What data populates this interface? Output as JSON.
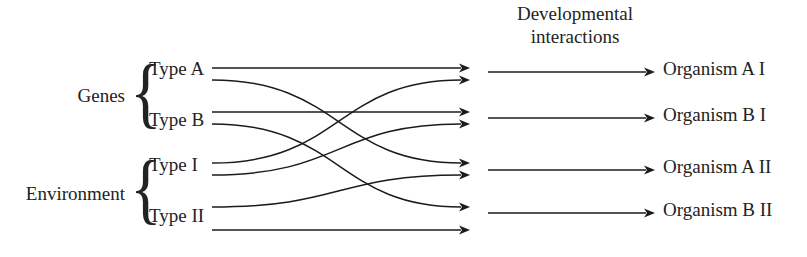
{
  "figure": {
    "title_line1": "Developmental",
    "title_line2": "interactions",
    "background_color": "#ffffff",
    "line_color": "#1b1b1b",
    "text_color": "#232323"
  },
  "groups": [
    {
      "id": "genes",
      "label": "Genes",
      "brace": "{",
      "types": [
        {
          "id": "type-a",
          "label": "Type A"
        },
        {
          "id": "type-b",
          "label": "Type B"
        }
      ]
    },
    {
      "id": "environment",
      "label": "Environment",
      "brace": "{",
      "types": [
        {
          "id": "type-i",
          "label": "Type I"
        },
        {
          "id": "type-ii",
          "label": "Type II"
        }
      ]
    }
  ],
  "outcomes": [
    {
      "id": "organism-a-i",
      "label": "Organism A I"
    },
    {
      "id": "organism-b-i",
      "label": "Organism B I"
    },
    {
      "id": "organism-a-ii",
      "label": "Organism A II"
    },
    {
      "id": "organism-b-ii",
      "label": "Organism B II"
    }
  ],
  "chart_data": {
    "type": "diagram",
    "title": "Developmental interactions",
    "sources": [
      {
        "id": "type-a",
        "label": "Type A",
        "ports": [
          68,
          80
        ]
      },
      {
        "id": "type-b",
        "label": "Type B",
        "ports": [
          112,
          124
        ]
      },
      {
        "id": "type-i",
        "label": "Type I",
        "ports": [
          163,
          175
        ]
      },
      {
        "id": "type-ii",
        "label": "Type II",
        "ports": [
          207,
          230
        ]
      }
    ],
    "targets": [
      {
        "id": "organism-a-i",
        "label": "Organism A I",
        "ports": [
          68,
          80
        ]
      },
      {
        "id": "organism-b-i",
        "label": "Organism B I",
        "ports": [
          112,
          124
        ]
      },
      {
        "id": "organism-a-ii",
        "label": "Organism A II",
        "ports": [
          163,
          175
        ]
      },
      {
        "id": "organism-b-ii",
        "label": "Organism B II",
        "ports": [
          207,
          230
        ]
      }
    ],
    "connections": [
      {
        "from": "type-a",
        "to": "organism-a-i",
        "from_y": 68,
        "to_y": 68,
        "kind": "straight"
      },
      {
        "from": "type-a",
        "to": "organism-a-ii",
        "from_y": 80,
        "to_y": 163,
        "kind": "curve-down"
      },
      {
        "from": "type-b",
        "to": "organism-b-i",
        "from_y": 112,
        "to_y": 112,
        "kind": "straight"
      },
      {
        "from": "type-b",
        "to": "organism-b-ii",
        "from_y": 124,
        "to_y": 207,
        "kind": "curve-down"
      },
      {
        "from": "type-i",
        "to": "organism-a-i",
        "from_y": 163,
        "to_y": 80,
        "kind": "curve-up"
      },
      {
        "from": "type-i",
        "to": "organism-b-i",
        "from_y": 175,
        "to_y": 124,
        "kind": "curve-up"
      },
      {
        "from": "type-ii",
        "to": "organism-a-ii",
        "from_y": 207,
        "to_y": 175,
        "kind": "curve-up"
      },
      {
        "from": "type-ii",
        "to": "organism-b-ii",
        "from_y": 230,
        "to_y": 230,
        "kind": "straight"
      }
    ],
    "output_arrows": [
      {
        "to": "organism-a-i",
        "y": 72
      },
      {
        "to": "organism-b-i",
        "y": 118
      },
      {
        "to": "organism-a-ii",
        "y": 170
      },
      {
        "to": "organism-b-ii",
        "y": 213
      }
    ]
  }
}
